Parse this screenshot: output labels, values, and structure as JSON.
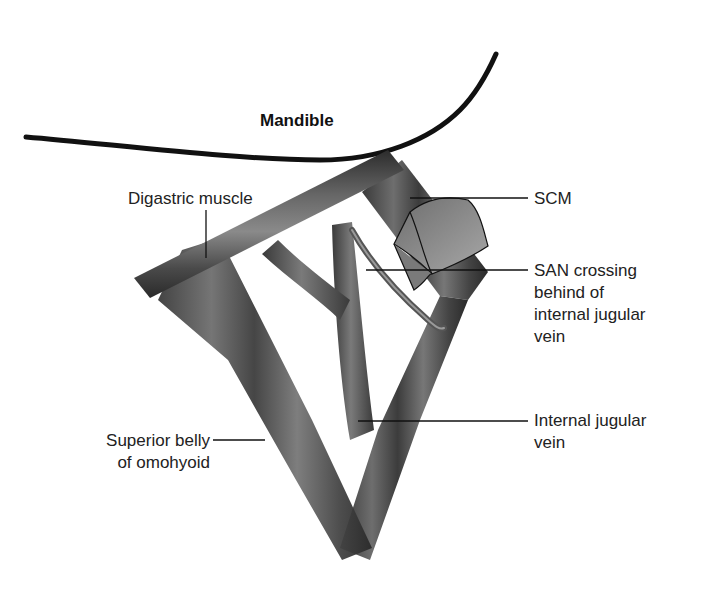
{
  "figure": {
    "type": "anatomical-diagram",
    "structures": [
      "Mandible",
      "Digastric muscle",
      "SCM",
      "Spinal accessory nerve",
      "Internal jugular vein",
      "Superior belly of omohyoid"
    ]
  },
  "labels": {
    "mandible": "Mandible",
    "digastric": "Digastric muscle",
    "scm": "SCM",
    "san": "SAN crossing\nbehind of\ninternal jugular\nvein",
    "ijv": "Internal jugular\nvein",
    "omohyoid": "Superior belly\nof omohyoid"
  },
  "colors": {
    "muscle_dark": "#2e2e2e",
    "muscle_mid": "#5a5a5a",
    "muscle_light": "#8a8a8a",
    "vein": "#555555",
    "scm_cut": "#9a9a9a",
    "leader_line": "#111111",
    "background": "#ffffff"
  }
}
